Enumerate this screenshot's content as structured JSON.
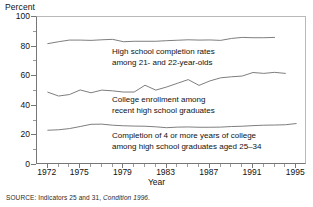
{
  "axis": {
    "y_title": "Percent",
    "x_title": "Year",
    "y_ticks": [
      "0",
      "20",
      "40",
      "60",
      "80",
      "100"
    ],
    "x_ticks": [
      "1972",
      "1975",
      "1979",
      "1983",
      "1987",
      "1991",
      "1995"
    ]
  },
  "annotations": {
    "high_school": {
      "line1": "High school completion rates",
      "line2": "among 21- and 22-year-olds"
    },
    "college_enroll": {
      "line1": "College enrollment among",
      "line2": "recent high school graduates"
    },
    "completion": {
      "line1": "Completion of 4 or more years of college",
      "line2": "among high school graduates aged 25–34"
    }
  },
  "source": {
    "prefix": "SOURCE:",
    "text": "Indicators 25 and 31,",
    "italic": "Condition 1996",
    "suffix": "."
  },
  "colors": {
    "line": "#6f6f6f",
    "axis": "#777777",
    "frame": "#b9b9b9",
    "text": "#111111"
  },
  "chart_data": {
    "type": "line",
    "title": "",
    "xlabel": "Year",
    "ylabel": "Percent",
    "xlim": [
      1971,
      1996
    ],
    "ylim": [
      0,
      100
    ],
    "grid": false,
    "legend": "inline-annotations",
    "x_tick_values": [
      1972,
      1975,
      1979,
      1983,
      1987,
      1991,
      1995
    ],
    "y_tick_values": [
      0,
      20,
      40,
      60,
      80,
      100
    ],
    "series": [
      {
        "name": "High school completion rates among 21- and 22-year-olds",
        "x": [
          1972,
          1973,
          1974,
          1975,
          1976,
          1977,
          1978,
          1979,
          1980,
          1981,
          1982,
          1983,
          1984,
          1985,
          1986,
          1987,
          1988,
          1989,
          1990,
          1991,
          1992,
          1993
        ],
        "values": [
          82.0,
          83.3,
          84.4,
          84.4,
          84.2,
          84.6,
          84.9,
          83.3,
          83.6,
          83.6,
          83.6,
          84.0,
          84.3,
          84.6,
          84.4,
          84.5,
          84.2,
          85.5,
          86.2,
          86.0,
          86.0,
          86.2
        ]
      },
      {
        "name": "College enrollment among recent high school graduates",
        "x": [
          1972,
          1973,
          1974,
          1975,
          1976,
          1977,
          1978,
          1979,
          1980,
          1981,
          1982,
          1983,
          1984,
          1985,
          1986,
          1987,
          1988,
          1989,
          1990,
          1991,
          1992,
          1993,
          1994
        ],
        "values": [
          49.2,
          46.6,
          47.6,
          50.7,
          48.8,
          50.6,
          50.1,
          49.3,
          49.3,
          53.9,
          50.6,
          52.7,
          55.2,
          57.7,
          53.8,
          56.8,
          58.9,
          59.6,
          60.1,
          62.5,
          61.9,
          62.6,
          61.9
        ]
      },
      {
        "name": "Completion of 4 or more years of college among high school graduates aged 25-34",
        "x": [
          1972,
          1973,
          1974,
          1975,
          1976,
          1977,
          1978,
          1979,
          1980,
          1981,
          1982,
          1983,
          1984,
          1985,
          1986,
          1987,
          1988,
          1989,
          1990,
          1991,
          1992,
          1993,
          1994,
          1995
        ],
        "values": [
          23.5,
          23.8,
          24.6,
          26.0,
          27.5,
          27.6,
          26.9,
          26.5,
          26.3,
          26.2,
          25.8,
          25.2,
          25.6,
          25.7,
          25.5,
          25.5,
          25.6,
          26.0,
          26.2,
          26.6,
          26.9,
          27.0,
          27.2,
          28.0
        ]
      }
    ]
  }
}
